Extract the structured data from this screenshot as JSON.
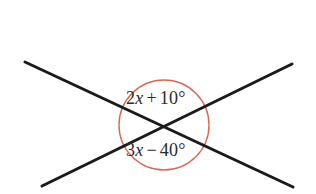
{
  "figure": {
    "kind": "geometry-diagram",
    "background_color": "#ffffff",
    "line_color": "#1a1a1a",
    "arc_color": "#d9684f",
    "text_color": "#2b2b2b",
    "line_width": 3,
    "arc_width": 1.4,
    "canvas": {
      "width": 316,
      "height": 194
    },
    "vertex": {
      "x": 165,
      "y": 126
    },
    "circle": {
      "cx": 164,
      "cy": 125,
      "r": 45
    },
    "lines": [
      {
        "name": "line-falling",
        "x1": 25,
        "y1": 62,
        "x2": 293,
        "y2": 187
      },
      {
        "name": "line-rising",
        "x1": 42,
        "y1": 186,
        "x2": 292,
        "y2": 64
      }
    ],
    "labels": {
      "top_angle": {
        "full_text": "2x + 10°",
        "coefficient": "2",
        "variable": "x",
        "operator": "+",
        "constant": "10°",
        "position": "above-vertex"
      },
      "bottom_angle": {
        "full_text": "3x − 40°",
        "coefficient": "3",
        "variable": "x",
        "operator": "−",
        "constant": "40°",
        "position": "below-vertex"
      }
    }
  }
}
